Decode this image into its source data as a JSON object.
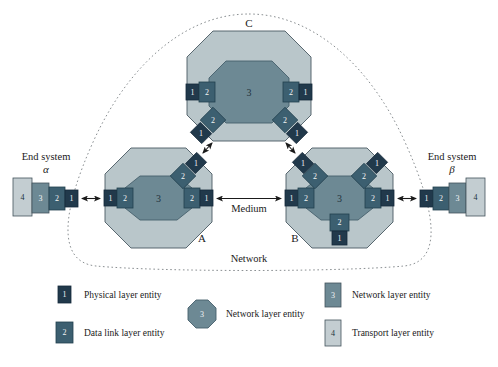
{
  "figure": {
    "network_label": "Network",
    "medium_label": "Medium"
  },
  "colors": {
    "physical": "#21394b",
    "datalink": "#3c5f70",
    "network_box": "#6d8994",
    "network_oct_inner": "#6d8994",
    "transport": "#c3cdd1",
    "node_outer": "#b9c6ca",
    "outline": "#3a4a52",
    "dotted_boundary": "#8a8f92",
    "text": "#1a1a1a",
    "background": "#ffffff"
  },
  "end_systems": [
    {
      "id": "alpha",
      "label": "End system",
      "symbol": "α",
      "side": "left",
      "stack": [
        {
          "num": "4",
          "layer": "transport"
        },
        {
          "num": "3",
          "layer": "network"
        },
        {
          "num": "2",
          "layer": "datalink"
        },
        {
          "num": "1",
          "layer": "physical"
        }
      ]
    },
    {
      "id": "beta",
      "label": "End system",
      "symbol": "β",
      "side": "right",
      "stack": [
        {
          "num": "1",
          "layer": "physical"
        },
        {
          "num": "2",
          "layer": "datalink"
        },
        {
          "num": "3",
          "layer": "network"
        },
        {
          "num": "4",
          "layer": "transport"
        }
      ]
    }
  ],
  "nodes": [
    {
      "id": "A",
      "label": "A",
      "core_num": "3",
      "interfaces": [
        {
          "position": "left",
          "outer": "1",
          "inner": "2"
        },
        {
          "position": "right",
          "outer": "1",
          "inner": "2"
        },
        {
          "position": "upper-right",
          "outer": "1",
          "inner": "2"
        }
      ]
    },
    {
      "id": "B",
      "label": "B",
      "core_num": "3",
      "interfaces": [
        {
          "position": "left",
          "outer": "1",
          "inner": "2"
        },
        {
          "position": "right",
          "outer": "1",
          "inner": "2"
        },
        {
          "position": "upper-left",
          "outer": "1",
          "inner": "2"
        },
        {
          "position": "upper-right",
          "outer": "1",
          "inner": "2"
        },
        {
          "position": "bottom",
          "outer": "1",
          "inner": "2"
        }
      ]
    },
    {
      "id": "C",
      "label": "C",
      "core_num": "3",
      "interfaces": [
        {
          "position": "left",
          "outer": "1",
          "inner": "2"
        },
        {
          "position": "right",
          "outer": "1",
          "inner": "2"
        },
        {
          "position": "lower-left",
          "outer": "1",
          "inner": "2"
        },
        {
          "position": "lower-right",
          "outer": "1",
          "inner": "2"
        }
      ]
    }
  ],
  "links": [
    {
      "from": "alpha",
      "to": "A",
      "label": ""
    },
    {
      "from": "A",
      "to": "B",
      "label": "Medium"
    },
    {
      "from": "B",
      "to": "beta",
      "label": ""
    },
    {
      "from": "A",
      "to": "C",
      "label": ""
    },
    {
      "from": "B",
      "to": "C",
      "label": ""
    }
  ],
  "legend": {
    "column_left": [
      {
        "num": "1",
        "shape": "square",
        "layer": "physical",
        "label": "Physical layer entity"
      },
      {
        "num": "2",
        "shape": "square",
        "layer": "datalink",
        "label": "Data link layer entity"
      }
    ],
    "column_middle": [
      {
        "num": "3",
        "shape": "octagon",
        "layer": "network",
        "label": "Network layer entity"
      }
    ],
    "column_right": [
      {
        "num": "3",
        "shape": "rect-tall",
        "layer": "network",
        "label": "Network layer entity"
      },
      {
        "num": "4",
        "shape": "rect-tall",
        "layer": "transport",
        "label": "Transport layer entity"
      }
    ]
  }
}
